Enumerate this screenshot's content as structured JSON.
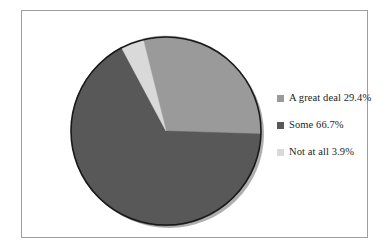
{
  "figure": {
    "background_color": "#ffffff",
    "border_color": "#9e9e9e"
  },
  "legend": {
    "position": "right",
    "entries": [
      {
        "label": "A great deal 29.4%",
        "color": "#9a9a9a",
        "swatch_name": "legend-swatch-a-great-deal"
      },
      {
        "label": "Some 66.7%",
        "color": "#585858",
        "swatch_name": "legend-swatch-some"
      },
      {
        "label": "Not at all 3.9%",
        "color": "#d9d9d9",
        "swatch_name": "legend-swatch-not-at-all"
      }
    ]
  },
  "chart_data": {
    "type": "pie",
    "title": "",
    "subtitle": "",
    "xlabel": "",
    "ylabel": "",
    "grid": false,
    "legend_position": "right",
    "start_angle_deg": 0,
    "direction": "clockwise",
    "outline_color": "#1a1a1a",
    "categories": [
      "A great deal",
      "Some",
      "Not at all"
    ],
    "values": [
      29.4,
      66.7,
      3.9
    ],
    "value_unit": "%",
    "slices": [
      {
        "label": "A great deal",
        "value": 29.4,
        "display": "29.4%",
        "color": "#9a9a9a"
      },
      {
        "label": "Some",
        "value": 66.7,
        "display": "66.7%",
        "color": "#585858"
      },
      {
        "label": "Not at all",
        "value": 3.9,
        "display": "3.9%",
        "color": "#d9d9d9"
      }
    ]
  }
}
